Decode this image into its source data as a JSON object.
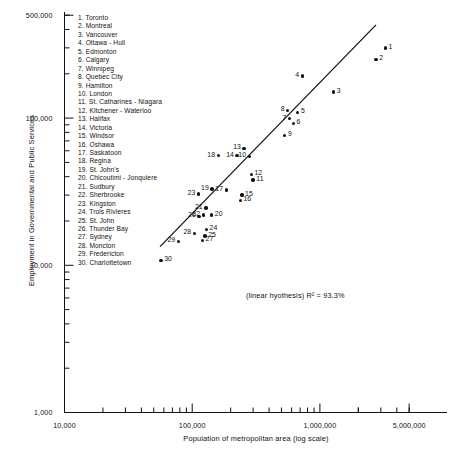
{
  "chart_data": {
    "type": "scatter",
    "title": "",
    "xlabel": "Population of metropolitan area (log scale)",
    "ylabel": "Employment in Governmental and Public Services",
    "xscale": "log",
    "yscale": "log",
    "xlim": [
      10000,
      5000000
    ],
    "ylim": [
      1000,
      500000
    ],
    "grid": false,
    "legend_position": "top-left",
    "xticklabels": [
      "10,000",
      "100,000",
      "1,000,000",
      "5,000,000"
    ],
    "xtickvalues": [
      10000,
      100000,
      1000000,
      5000000
    ],
    "yticklabels": [
      "1,000",
      "10,000",
      "100,000",
      "500,000"
    ],
    "ytickvalues": [
      1000,
      10000,
      100000,
      500000
    ],
    "annotation": "(linear hyothesis)  R² = 93.3%",
    "trendline": {
      "label": "linear fit",
      "r_squared": "93.3%",
      "x_start": 56000,
      "y_start": 13400,
      "x_end": 2750000,
      "y_end": 430000
    },
    "points": [
      {
        "n": "1",
        "name": "Toronto",
        "x": 3250000,
        "y": 300000,
        "label_side": "right"
      },
      {
        "n": "2",
        "name": "Montreal",
        "x": 2750000,
        "y": 250000,
        "label_side": "right"
      },
      {
        "n": "3",
        "name": "Vancouver",
        "x": 1280000,
        "y": 150000,
        "label_side": "right"
      },
      {
        "n": "4",
        "name": "Ottawa - Hull",
        "x": 730000,
        "y": 193000,
        "label_side": "left"
      },
      {
        "n": "5",
        "name": "Edmonton",
        "x": 670000,
        "y": 109000,
        "label_side": "right"
      },
      {
        "n": "6",
        "name": "Calgary",
        "x": 620000,
        "y": 92000,
        "label_side": "right"
      },
      {
        "n": "7",
        "name": "Winnipeg",
        "x": 580000,
        "y": 99000,
        "label_side": "left"
      },
      {
        "n": "8",
        "name": "Quebec City",
        "x": 560000,
        "y": 113000,
        "label_side": "left"
      },
      {
        "n": "9",
        "name": "Hamilton",
        "x": 530000,
        "y": 76000,
        "label_side": "right"
      },
      {
        "n": "10",
        "name": "London",
        "x": 280000,
        "y": 55000,
        "label_side": "left"
      },
      {
        "n": "11",
        "name": "St. Catharines - Niagara",
        "x": 300000,
        "y": 38000,
        "label_side": "right"
      },
      {
        "n": "12",
        "name": "Kitchener - Waterloo",
        "x": 290000,
        "y": 41500,
        "label_side": "right"
      },
      {
        "n": "13",
        "name": "Halifax",
        "x": 255000,
        "y": 62000,
        "label_side": "left"
      },
      {
        "n": "14",
        "name": "Victoria",
        "x": 225000,
        "y": 55500,
        "label_side": "left"
      },
      {
        "n": "15",
        "name": "Windsor",
        "x": 245000,
        "y": 30000,
        "label_side": "right"
      },
      {
        "n": "16",
        "name": "Oshawa",
        "x": 238000,
        "y": 27500,
        "label_side": "right"
      },
      {
        "n": "17",
        "name": "Saskatoon",
        "x": 185000,
        "y": 32500,
        "label_side": "left"
      },
      {
        "n": "18",
        "name": "Regina",
        "x": 160000,
        "y": 55500,
        "label_side": "left"
      },
      {
        "n": "19",
        "name": "St. John's",
        "x": 143000,
        "y": 33000,
        "label_side": "left"
      },
      {
        "n": "20",
        "name": "Chicoutimi - Jonquiere",
        "x": 142000,
        "y": 22000,
        "label_side": "right"
      },
      {
        "n": "21",
        "name": "Sudbury",
        "x": 128000,
        "y": 24500,
        "label_side": "left"
      },
      {
        "n": "22",
        "name": "Sherbrooke",
        "x": 122000,
        "y": 22000,
        "label_side": "left"
      },
      {
        "n": "23",
        "name": "Kingston",
        "x": 112000,
        "y": 30500,
        "label_side": "left"
      },
      {
        "n": "24",
        "name": "Trois Rivieres",
        "x": 129000,
        "y": 17500,
        "label_side": "right"
      },
      {
        "n": "25",
        "name": "St. John",
        "x": 126000,
        "y": 15800,
        "label_side": "right"
      },
      {
        "n": "26",
        "name": "Thunder Bay",
        "x": 113000,
        "y": 21500,
        "label_side": "left"
      },
      {
        "n": "27",
        "name": "Sydney",
        "x": 120000,
        "y": 14700,
        "label_side": "right"
      },
      {
        "n": "28",
        "name": "Moncton",
        "x": 104000,
        "y": 16400,
        "label_side": "left"
      },
      {
        "n": "29",
        "name": "Fredericton",
        "x": 78000,
        "y": 14500,
        "label_side": "left"
      },
      {
        "n": "30",
        "name": "Charlottetown",
        "x": 57000,
        "y": 10800,
        "label_side": "right"
      }
    ],
    "legend_items": [
      "1. Toronto",
      "2. Montreal",
      "3. Vancouver",
      "4. Ottawa - Hull",
      "5. Edmonton",
      "6. Calgary",
      "7. Winnipeg",
      "8. Quebec City",
      "9. Hamilton",
      "10. London",
      "11. St. Catharines - Niagara",
      "12. Kitchener - Waterloo",
      "13. Halifax",
      "14. Victoria",
      "15. Windsor",
      "16. Oshawa",
      "17. Saskatoon",
      "18. Regina",
      "19. St. John's",
      "20. Chicoutimi - Jonquiere",
      "21. Sudbury",
      "22. Sherbrooke",
      "23. Kingston",
      "24. Trois Rivieres",
      "25. St. John",
      "26. Thunder Bay",
      "27. Sydney",
      "28. Moncton",
      "29. Fredericton",
      "30. Charlottetown"
    ]
  }
}
